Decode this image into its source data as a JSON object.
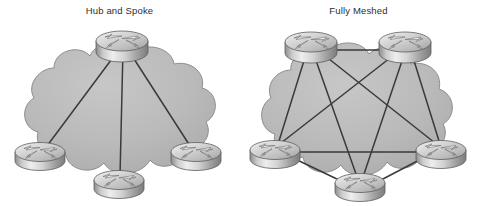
{
  "figure": {
    "type": "network-topology-comparison",
    "background_color": "#ffffff",
    "width": 478,
    "height": 206,
    "panels": [
      {
        "id": "hub-and-spoke",
        "title": "Hub and Spoke",
        "topology": "hub-and-spoke",
        "node_count": 4,
        "link_count": 3,
        "cloud_label": "",
        "nodes": [
          {
            "id": "hub",
            "role": "hub",
            "icon": "router-icon",
            "cx": 122,
            "cy": 41,
            "rx": 26,
            "ry": 10,
            "body_h": 11
          },
          {
            "id": "spoke1",
            "role": "spoke",
            "icon": "router-icon",
            "cx": 40,
            "cy": 152,
            "rx": 25,
            "ry": 9.5,
            "body_h": 10
          },
          {
            "id": "spoke2",
            "role": "spoke",
            "icon": "router-icon",
            "cx": 119,
            "cy": 180,
            "rx": 25,
            "ry": 9.5,
            "body_h": 10
          },
          {
            "id": "spoke3",
            "role": "spoke",
            "icon": "router-icon",
            "cx": 196,
            "cy": 152,
            "rx": 25,
            "ry": 9.5,
            "body_h": 10
          }
        ],
        "links": [
          {
            "from": "hub",
            "to": "spoke1"
          },
          {
            "from": "hub",
            "to": "spoke2"
          },
          {
            "from": "hub",
            "to": "spoke3"
          }
        ]
      },
      {
        "id": "fully-meshed",
        "title": "Fully Meshed",
        "topology": "full-mesh",
        "node_count": 5,
        "link_count": 10,
        "cloud_label": "",
        "nodes": [
          {
            "id": "r1",
            "role": "peer",
            "icon": "router-icon",
            "cx": 72,
            "cy": 42,
            "rx": 26,
            "ry": 10,
            "body_h": 11
          },
          {
            "id": "r2",
            "role": "peer",
            "icon": "router-icon",
            "cx": 166,
            "cy": 42,
            "rx": 26,
            "ry": 10,
            "body_h": 11
          },
          {
            "id": "r3",
            "role": "peer",
            "icon": "router-icon",
            "cx": 36,
            "cy": 150,
            "rx": 25,
            "ry": 9.5,
            "body_h": 10
          },
          {
            "id": "r4",
            "role": "peer",
            "icon": "router-icon",
            "cx": 202,
            "cy": 150,
            "rx": 25,
            "ry": 9.5,
            "body_h": 10
          },
          {
            "id": "r5",
            "role": "peer",
            "icon": "router-icon",
            "cx": 121,
            "cy": 183,
            "rx": 25,
            "ry": 9.5,
            "body_h": 10
          }
        ],
        "links": [
          {
            "from": "r1",
            "to": "r2"
          },
          {
            "from": "r1",
            "to": "r3"
          },
          {
            "from": "r1",
            "to": "r4"
          },
          {
            "from": "r1",
            "to": "r5"
          },
          {
            "from": "r2",
            "to": "r3"
          },
          {
            "from": "r2",
            "to": "r4"
          },
          {
            "from": "r2",
            "to": "r5"
          },
          {
            "from": "r3",
            "to": "r4"
          },
          {
            "from": "r3",
            "to": "r5"
          },
          {
            "from": "r4",
            "to": "r5"
          }
        ]
      }
    ]
  },
  "colors": {
    "background": "#ffffff",
    "cloud_fill": "#b7b7b7",
    "cloud_fill_light": "#c9c9c9",
    "cloud_stroke": "#8a8a8a",
    "link_stroke": "#3a3a3a",
    "router_top_light": "#f2f2f2",
    "router_top_mid": "#cfcfcf",
    "router_top_dark": "#9a9a9a",
    "router_body_light": "#e8e8e8",
    "router_body_dark": "#7e7e7e",
    "router_outline": "#5d5d5d",
    "arrow_fill": "#fbfbfb",
    "arrow_stroke": "#6e6e6e",
    "title_text": "#2d2d2d"
  }
}
